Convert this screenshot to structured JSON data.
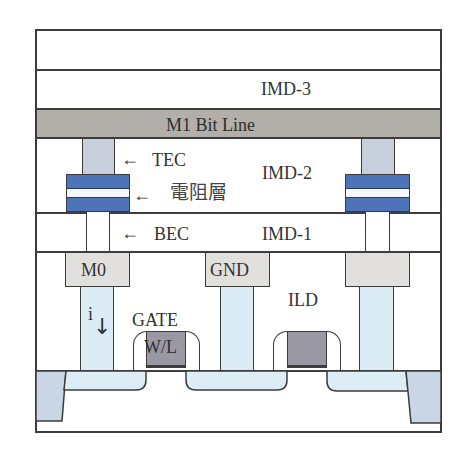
{
  "diagram": {
    "type": "cross-section",
    "layers": {
      "imd3": "IMD-3",
      "m1": "M1 Bit Line",
      "imd2": "IMD-2",
      "imd1": "IMD-1",
      "ild": "ILD"
    },
    "annotations": {
      "tec": "TEC",
      "resistive_layer": "電阻層",
      "bec": "BEC",
      "arrow": "←"
    },
    "contacts": {
      "m0": "M0",
      "gnd": "GND",
      "right_m0": ""
    },
    "gate": {
      "label_top": "GATE",
      "label_poly": "W/L"
    },
    "current": {
      "label": "i",
      "arrow": "↓"
    },
    "colors": {
      "outline": "#3b3b3b",
      "m1_fill": "#b2aea9",
      "tec_fill": "#c8cfdc",
      "mtj_blue": "#4d74b8",
      "m0_fill": "#e2e0dd",
      "via_fill": "#dcecf6",
      "poly_fill": "#9a99a3",
      "sti_fill": "#c9d6e6",
      "diffusion_fill": "#dcedf6"
    }
  }
}
